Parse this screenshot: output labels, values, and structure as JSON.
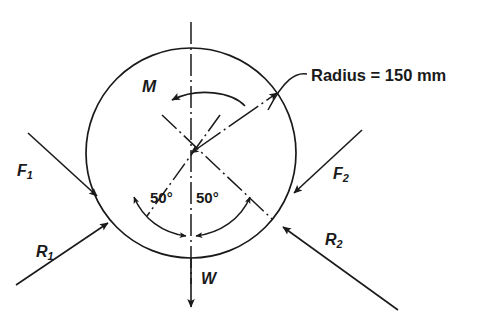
{
  "diagram": {
    "type": "free-body-diagram",
    "annotations": {
      "radius_label": "Radius = 150 mm",
      "moment_label": "M",
      "weight_label": "W",
      "force_left_base": "F",
      "force_left_sub": "1",
      "force_right_base": "F",
      "force_right_sub": "2",
      "reaction_left_base": "R",
      "reaction_left_sub": "1",
      "reaction_right_base": "R",
      "reaction_right_sub": "2",
      "angle_left": "50°",
      "angle_right": "50°"
    },
    "geometry": {
      "center_x": 191,
      "center_y": 153,
      "radius_px": 105,
      "radius_value": 150,
      "radius_units": "mm",
      "half_angle_deg": 50,
      "moment_sense": "counterclockwise",
      "weight_direction": "down"
    },
    "colors": {
      "line": "#1a1a1a",
      "text": "#1a1a1a",
      "background": "#ffffff"
    }
  }
}
